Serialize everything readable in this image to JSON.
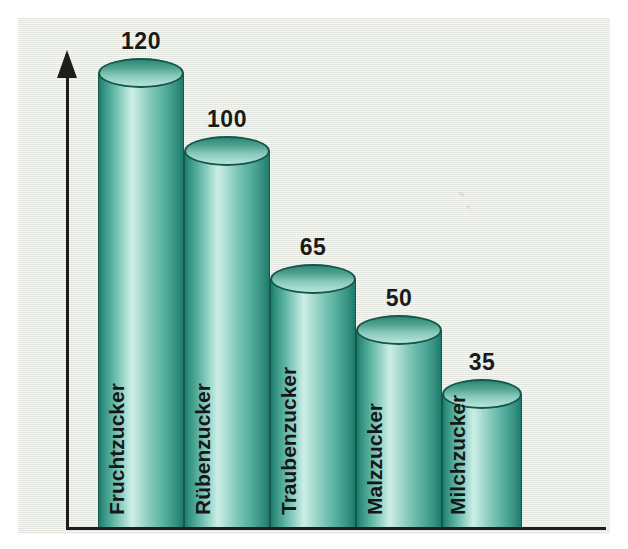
{
  "chart_data": {
    "type": "bar",
    "title": "",
    "subtitle": "",
    "xlabel": "",
    "ylabel": "",
    "categories": [
      "Fruchtzucker",
      "Rübenzucker",
      "Traubenzucker",
      "Malzzucker",
      "Milchzucker"
    ],
    "values": [
      120,
      100,
      65,
      50,
      35
    ],
    "value_labels": [
      "120",
      "100",
      "65",
      "50",
      "35"
    ],
    "ylim": [
      0,
      130
    ],
    "grid": false,
    "legend": null,
    "axis_style": {
      "y_axis_arrow": true,
      "y_tick_labels": [],
      "x_tick_labels": []
    },
    "series": [
      {
        "name": "Süßkraft",
        "values": [
          120,
          100,
          65,
          50,
          35
        ]
      }
    ],
    "style": {
      "bar_shape": "cylinder",
      "bar_fill_light": "#cdeee6",
      "bar_fill_mid": "#5cb3a2",
      "bar_fill_dark": "#1e7a6a",
      "bar_outline": "#14564b",
      "axis_color": "#1d1d1b",
      "background": "#ecefe8",
      "text_color": "#17171a"
    }
  },
  "bars": [
    {
      "label": "Fruchtzucker",
      "value_label": "120",
      "left": 80,
      "width": 86,
      "height": 454
    },
    {
      "label": "Rübenzucker",
      "value_label": "100",
      "left": 166,
      "width": 86,
      "height": 376
    },
    {
      "label": "Traubenzucker",
      "value_label": "65",
      "left": 252,
      "width": 86,
      "height": 248
    },
    {
      "label": "Malzzucker",
      "value_label": "50",
      "left": 338,
      "width": 86,
      "height": 197
    },
    {
      "label": "Milchzucker",
      "value_label": "35",
      "left": 424,
      "width": 80,
      "height": 133
    }
  ],
  "icons": {
    "y_axis_arrow": "arrow-up-icon"
  }
}
